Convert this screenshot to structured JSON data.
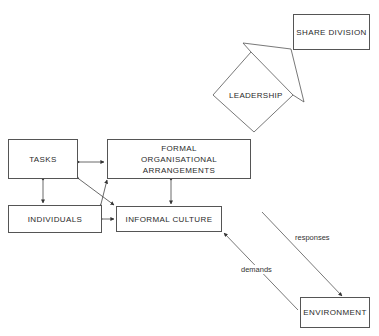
{
  "header": {
    "cut_off_title": "······ ·······"
  },
  "nodes": {
    "share_division": "SHARE DIVISION",
    "leadership": "LEADERSHIP",
    "tasks": "TASKS",
    "formal": "FORMAL ORGANISATIONAL ARRANGEMENTS",
    "individuals": "INDIVIDUALS",
    "informal": "INFORMAL CULTURE",
    "environment": "ENVIRONMENT"
  },
  "edges": {
    "responses": "responses",
    "demands": "demands"
  },
  "colors": {
    "line": "#555555",
    "text": "#2a2a2a"
  }
}
